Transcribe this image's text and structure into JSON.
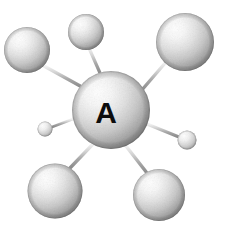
{
  "figure": {
    "type": "ball-and-stick-molecular-model",
    "background_color": "#ffffff",
    "width": 227,
    "height": 240
  },
  "palette": {
    "sphere_highlight": "#ffffff",
    "sphere_midtone": "#d8d8d8",
    "sphere_shadow": "#8a8a8a",
    "sphere_edge": "#6e6e6e",
    "bond_light": "#e2e2e2",
    "bond_mid": "#b0b0b0",
    "bond_dark": "#8c8c8c",
    "label_color": "#0d0d0d"
  },
  "center_atom": {
    "id": "atom-a",
    "label": "A",
    "cx": 111,
    "cy": 110,
    "r": 39,
    "font_size": 30,
    "label_x": 106,
    "label_y": 112
  },
  "ligand_atoms": [
    {
      "id": "atom-top-left",
      "label": "",
      "cx": 27,
      "cy": 50,
      "r": 23,
      "size": "large"
    },
    {
      "id": "atom-top",
      "label": "",
      "cx": 86,
      "cy": 32,
      "r": 18,
      "size": "medium"
    },
    {
      "id": "atom-top-right",
      "label": "",
      "cx": 185,
      "cy": 42,
      "r": 29,
      "size": "large"
    },
    {
      "id": "atom-left-small",
      "label": "",
      "cx": 45,
      "cy": 129,
      "r": 7.5,
      "size": "small"
    },
    {
      "id": "atom-right-small",
      "label": "",
      "cx": 187,
      "cy": 140,
      "r": 9.5,
      "size": "small"
    },
    {
      "id": "atom-bottom-left",
      "label": "",
      "cx": 55,
      "cy": 191,
      "r": 27.5,
      "size": "large"
    },
    {
      "id": "atom-bottom-right",
      "label": "",
      "cx": 159,
      "cy": 195,
      "r": 26,
      "size": "large"
    }
  ],
  "bonds": [
    {
      "id": "bond-top-left",
      "from": "atom-a",
      "to": "atom-top-left",
      "x1": 82,
      "y1": 87,
      "x2": 44,
      "y2": 66,
      "width": 3.4
    },
    {
      "id": "bond-top",
      "from": "atom-a",
      "to": "atom-top",
      "x1": 100,
      "y1": 73,
      "x2": 89,
      "y2": 48,
      "width": 3.2
    },
    {
      "id": "bond-top-right",
      "from": "atom-a",
      "to": "atom-top-right",
      "x1": 141,
      "y1": 91,
      "x2": 166,
      "y2": 62,
      "width": 3.4
    },
    {
      "id": "bond-left-small",
      "from": "atom-a",
      "to": "atom-left-small",
      "x1": 73,
      "y1": 119,
      "x2": 52,
      "y2": 127,
      "width": 2.8
    },
    {
      "id": "bond-right-small",
      "from": "atom-a",
      "to": "atom-right-small",
      "x1": 147,
      "y1": 124,
      "x2": 179,
      "y2": 137,
      "width": 3.2
    },
    {
      "id": "bond-bottom-left",
      "from": "atom-a",
      "to": "atom-bottom-left",
      "x1": 93,
      "y1": 144,
      "x2": 70,
      "y2": 168,
      "width": 3.4
    },
    {
      "id": "bond-bottom-right",
      "from": "atom-a",
      "to": "atom-bottom-right",
      "x1": 126,
      "y1": 146,
      "x2": 147,
      "y2": 173,
      "width": 3.4
    }
  ]
}
